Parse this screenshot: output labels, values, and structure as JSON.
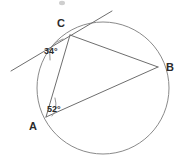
{
  "figure": {
    "background_color": "#ffffff",
    "stroke_color": "#6e6e6e",
    "circle_color": "#8a8a8a",
    "label_color": "#2b2b2b"
  },
  "points": {
    "a": {
      "label": "A",
      "x": 46,
      "y": 117,
      "label_x": 33,
      "label_y": 130
    },
    "b": {
      "label": "B",
      "x": 158,
      "y": 67,
      "label_x": 166,
      "label_y": 71
    },
    "c": {
      "label": "C",
      "x": 70,
      "y": 35,
      "label_x": 61,
      "label_y": 27
    }
  },
  "circle": {
    "center_x": 103,
    "center_y": 88,
    "radius": 66
  },
  "tangent": {
    "name": "tangent-at-c",
    "x1": 11,
    "y1": 71,
    "x2": 112,
    "y2": 11
  },
  "chords": [
    {
      "name": "chord-ca",
      "x1": 70,
      "y1": 35,
      "x2": 46,
      "y2": 117
    },
    {
      "name": "chord-cb",
      "x1": 70,
      "y1": 35,
      "x2": 158,
      "y2": 67
    },
    {
      "name": "chord-ab",
      "x1": 46,
      "y1": 117,
      "x2": 158,
      "y2": 67
    }
  ],
  "angles": {
    "at_c": {
      "value": "34°",
      "label_x": 44,
      "label_y": 54,
      "arc_path": "M 50 60 Q 47 44 63 39"
    },
    "at_a": {
      "value": "52°",
      "label_x": 47,
      "label_y": 112,
      "arc_path": "M 55 98 Q 58 109 52 116"
    }
  },
  "artifact": {
    "name": "scan-speck",
    "x": 62,
    "y": 3,
    "rx": 3,
    "ry": 2.2
  }
}
